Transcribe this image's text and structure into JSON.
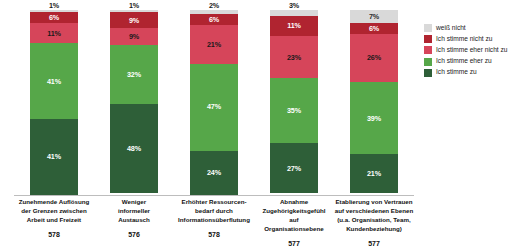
{
  "chart_data": {
    "type": "bar",
    "subtype": "100% stacked column",
    "title": "",
    "subtitle": "",
    "xlabel": "",
    "ylabel": "",
    "ylim": [
      0,
      100
    ],
    "grid": false,
    "legend_position": "right",
    "value_suffix": "%",
    "categories": [
      "Zunehmende Auflösung der Grenzen zwischen Arbeit und Freizeit",
      "Weniger informeller Austausch",
      "Erhöhter Ressourcenbedarf durch Informationsüberflutung",
      "Abnahme Zugehörigkeitsgefühl auf Organisationsebene",
      "Etablierung von Vertrauen auf verschiedenen Ebenen (u.a. Organisation, Team, Kundenbeziehung)"
    ],
    "sample_sizes": [
      578,
      576,
      578,
      577,
      577
    ],
    "series": [
      {
        "name": "weiß nicht",
        "color": "#d9d9d9",
        "values": [
          1,
          1,
          2,
          3,
          7
        ]
      },
      {
        "name": "Ich stimme nicht zu",
        "color": "#b02430",
        "values": [
          6,
          9,
          6,
          11,
          6
        ]
      },
      {
        "name": "Ich stimme eher nicht zu",
        "color": "#d6455a",
        "values": [
          11,
          9,
          21,
          23,
          26
        ]
      },
      {
        "name": "Ich stimme eher zu",
        "color": "#56a749",
        "values": [
          41,
          32,
          47,
          35,
          39
        ]
      },
      {
        "name": "Ich stimme zu",
        "color": "#2e5f38",
        "values": [
          41,
          48,
          24,
          27,
          21
        ]
      }
    ]
  },
  "bars": [
    {
      "label_lines": [
        "Zunehmende Auflösung",
        "der Grenzen zwischen",
        "Arbeit und Freizeit"
      ],
      "n": "578",
      "segments": [
        {
          "series": "weiß nicht",
          "label": "1%"
        },
        {
          "series": "Ich stimme nicht zu",
          "label": "6%"
        },
        {
          "series": "Ich stimme eher nicht zu",
          "label": "11%"
        },
        {
          "series": "Ich stimme eher zu",
          "label": "41%"
        },
        {
          "series": "Ich stimme zu",
          "label": "41%"
        }
      ]
    },
    {
      "label_lines": [
        "Weniger",
        "informeller",
        "Austausch"
      ],
      "n": "576",
      "segments": [
        {
          "series": "weiß nicht",
          "label": "1%"
        },
        {
          "series": "Ich stimme nicht zu",
          "label": "9%"
        },
        {
          "series": "Ich stimme eher nicht zu",
          "label": "9%"
        },
        {
          "series": "Ich stimme eher zu",
          "label": "32%"
        },
        {
          "series": "Ich stimme zu",
          "label": "48%"
        }
      ]
    },
    {
      "label_lines": [
        "Erhöhter Ressourcen-",
        "bedarf durch",
        "Informationsüberflutung"
      ],
      "n": "578",
      "segments": [
        {
          "series": "weiß nicht",
          "label": "2%"
        },
        {
          "series": "Ich stimme nicht zu",
          "label": "6%"
        },
        {
          "series": "Ich stimme eher nicht zu",
          "label": "21%"
        },
        {
          "series": "Ich stimme eher zu",
          "label": "47%"
        },
        {
          "series": "Ich stimme zu",
          "label": "24%"
        }
      ]
    },
    {
      "label_lines": [
        "Abnahme",
        "Zugehörigkeitsgefühl",
        "auf",
        "Organisationsebene"
      ],
      "n": "577",
      "segments": [
        {
          "series": "weiß nicht",
          "label": "3%"
        },
        {
          "series": "Ich stimme nicht zu",
          "label": "11%"
        },
        {
          "series": "Ich stimme eher nicht zu",
          "label": "23%"
        },
        {
          "series": "Ich stimme eher zu",
          "label": "35%"
        },
        {
          "series": "Ich stimme zu",
          "label": "27%"
        }
      ]
    },
    {
      "label_lines": [
        "Etablierung von Vertrauen",
        "auf verschiedenen Ebenen",
        "(u.a. Organisation, Team,",
        "Kundenbeziehung)"
      ],
      "n": "577",
      "segments": [
        {
          "series": "weiß nicht",
          "label": "7%"
        },
        {
          "series": "Ich stimme nicht zu",
          "label": "6%"
        },
        {
          "series": "Ich stimme eher nicht zu",
          "label": "26%"
        },
        {
          "series": "Ich stimme eher zu",
          "label": "39%"
        },
        {
          "series": "Ich stimme zu",
          "label": "21%"
        }
      ]
    }
  ],
  "legend": {
    "items": [
      {
        "label": "weiß nicht",
        "color": "#d9d9d9"
      },
      {
        "label": "Ich stimme nicht zu",
        "color": "#b02430"
      },
      {
        "label": "Ich stimme eher nicht zu",
        "color": "#d6455a"
      },
      {
        "label": "Ich stimme eher zu",
        "color": "#56a749"
      },
      {
        "label": "Ich stimme zu",
        "color": "#2e5f38"
      }
    ]
  }
}
